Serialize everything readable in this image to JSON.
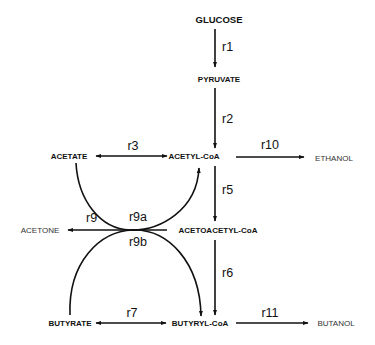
{
  "diagram": {
    "type": "metabolic-pathway",
    "nodes": {
      "glucose": "GLUCOSE",
      "pyruvate": "PYRUVATE",
      "acetate": "ACETATE",
      "acetyl_coa": "ACETYL-CoA",
      "ethanol": "ETHANOL",
      "acetone": "ACETONE",
      "acetoacetyl_coa": "ACETOACETYL-CoA",
      "butyrate": "BUTYRATE",
      "butyryl_coa": "BUTYRYL-CoA",
      "butanol": "BUTANOL"
    },
    "reactions": {
      "r1": "r1",
      "r2": "r2",
      "r3": "r3",
      "r5": "r5",
      "r6": "r6",
      "r7": "r7",
      "r9": "r9",
      "r9a": "r9a",
      "r9b": "r9b",
      "r10": "r10",
      "r11": "r11"
    },
    "edges": [
      {
        "id": "r1",
        "from": "GLUCOSE",
        "to": "PYRUVATE",
        "direction": "forward"
      },
      {
        "id": "r2",
        "from": "PYRUVATE",
        "to": "ACETYL-CoA",
        "direction": "forward"
      },
      {
        "id": "r3",
        "from": "ACETATE",
        "to": "ACETYL-CoA",
        "direction": "bidirectional"
      },
      {
        "id": "r10",
        "from": "ACETYL-CoA",
        "to": "ETHANOL",
        "direction": "forward"
      },
      {
        "id": "r5",
        "from": "ACETYL-CoA",
        "to": "ACETOACETYL-CoA",
        "direction": "forward"
      },
      {
        "id": "r9",
        "from": "ACETOACETYL-CoA",
        "to": "ACETONE",
        "direction": "forward"
      },
      {
        "id": "r9a",
        "from": "ACETATE",
        "to": "ACETYL-CoA",
        "direction": "forward"
      },
      {
        "id": "r9b",
        "from": "BUTYRATE",
        "to": "BUTYRYL-CoA",
        "direction": "forward"
      },
      {
        "id": "r6",
        "from": "ACETOACETYL-CoA",
        "to": "BUTYRYL-CoA",
        "direction": "forward"
      },
      {
        "id": "r7",
        "from": "BUTYRATE",
        "to": "BUTYRYL-CoA",
        "direction": "bidirectional"
      },
      {
        "id": "r11",
        "from": "BUTYRYL-CoA",
        "to": "BUTANOL",
        "direction": "forward"
      }
    ]
  }
}
